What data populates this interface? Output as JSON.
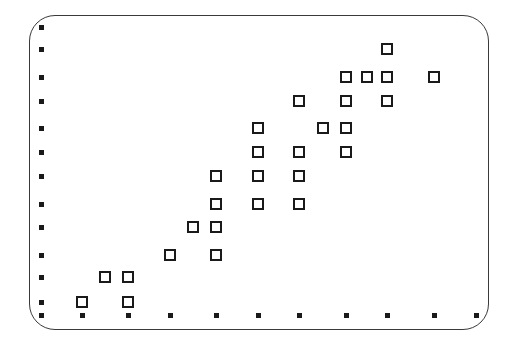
{
  "chart_data": {
    "type": "scatter",
    "title": "",
    "xlabel": "",
    "ylabel": "",
    "grid": false,
    "legend": null,
    "marker": "open-square",
    "xlim": [
      0,
      10
    ],
    "ylim": [
      0,
      12
    ],
    "x_ticks": [
      0,
      1,
      2,
      3,
      4,
      5,
      6,
      7,
      8,
      9,
      10
    ],
    "y_ticks": [
      0,
      1,
      2,
      3,
      4,
      5,
      6,
      7,
      8,
      9,
      10,
      11,
      12
    ],
    "x_tick_labels": [],
    "y_tick_labels": [],
    "x_tick_px": [
      41,
      82,
      128,
      170,
      216,
      258,
      299,
      346,
      387,
      434,
      476
    ],
    "y_tick_px": [
      315,
      302,
      277,
      255,
      227,
      204,
      176,
      152,
      128,
      101,
      77,
      49,
      27
    ],
    "points": [
      {
        "x": 1,
        "y": 1
      },
      {
        "x": 1.5,
        "y": 2
      },
      {
        "x": 2,
        "y": 2
      },
      {
        "x": 2,
        "y": 1
      },
      {
        "x": 3,
        "y": 3
      },
      {
        "x": 3.5,
        "y": 4
      },
      {
        "x": 4,
        "y": 6
      },
      {
        "x": 4,
        "y": 5
      },
      {
        "x": 4,
        "y": 4
      },
      {
        "x": 4,
        "y": 3
      },
      {
        "x": 5,
        "y": 8
      },
      {
        "x": 5,
        "y": 7
      },
      {
        "x": 5,
        "y": 6
      },
      {
        "x": 5,
        "y": 5
      },
      {
        "x": 6,
        "y": 9
      },
      {
        "x": 6,
        "y": 7
      },
      {
        "x": 6,
        "y": 6
      },
      {
        "x": 6,
        "y": 5
      },
      {
        "x": 6.5,
        "y": 8
      },
      {
        "x": 7,
        "y": 10
      },
      {
        "x": 7,
        "y": 9
      },
      {
        "x": 7,
        "y": 8
      },
      {
        "x": 7,
        "y": 7
      },
      {
        "x": 7.5,
        "y": 10
      },
      {
        "x": 8,
        "y": 11
      },
      {
        "x": 8,
        "y": 10
      },
      {
        "x": 8,
        "y": 9
      },
      {
        "x": 9,
        "y": 10
      }
    ],
    "colors": {
      "marker": "#1a1a1a",
      "frame": "#3a3a3a",
      "background": "#ffffff"
    }
  }
}
